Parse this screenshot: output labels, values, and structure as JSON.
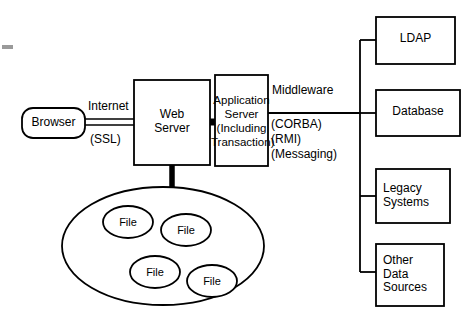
{
  "diagram": {
    "stroke_color": "#000000",
    "background_color": "#ffffff",
    "nodes": {
      "browser": {
        "label": "Browser",
        "shape": "rounded-rectangle"
      },
      "web_server": {
        "label": "Web\nServer",
        "shape": "rectangle"
      },
      "app_server": {
        "label": "Application\nServer\n(Including\nTransaction)",
        "shape": "rectangle"
      },
      "ldap": {
        "label": "LDAP",
        "shape": "rectangle"
      },
      "database": {
        "label": "Database",
        "shape": "rectangle"
      },
      "legacy": {
        "label": "Legacy\nSystems",
        "shape": "rectangle"
      },
      "other_sources": {
        "label": "Other\nData\nSources",
        "shape": "rectangle"
      },
      "file_store": {
        "label": "",
        "shape": "ellipse"
      },
      "file_1": {
        "label": "File",
        "shape": "ellipse"
      },
      "file_2": {
        "label": "File",
        "shape": "ellipse"
      },
      "file_3": {
        "label": "File",
        "shape": "ellipse"
      },
      "file_4": {
        "label": "File",
        "shape": "ellipse"
      }
    },
    "edge_labels": {
      "internet": "Internet",
      "ssl": "(SSL)",
      "middleware": "Middleware",
      "corba": "(CORBA)",
      "rmi": "(RMI)",
      "messaging": "(Messaging)"
    }
  }
}
